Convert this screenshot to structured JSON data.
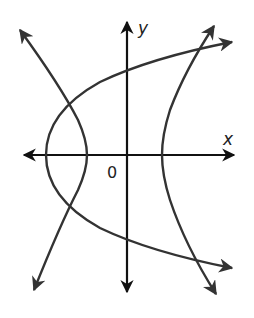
{
  "diagram": {
    "type": "coordinate-plot",
    "colors": {
      "axes": "#111111",
      "curves": "#333333",
      "background": "#ffffff"
    },
    "labels": {
      "x_axis": "x",
      "y_axis": "y",
      "origin": "0"
    },
    "curves": [
      {
        "name": "parabola",
        "opens": "right",
        "vertex_px": [
          46,
          155
        ]
      },
      {
        "name": "hyperbola-left-branch",
        "vertex_px": [
          87,
          155
        ]
      },
      {
        "name": "hyperbola-right-branch",
        "vertex_px": [
          162,
          155
        ]
      }
    ]
  }
}
